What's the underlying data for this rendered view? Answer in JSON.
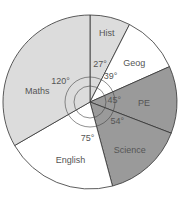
{
  "chart_data": {
    "type": "pie",
    "title": "",
    "start_angle_deg": 0,
    "direction": "clockwise",
    "categories": [
      "Hist",
      "Geog",
      "PE",
      "Science",
      "English",
      "Maths"
    ],
    "values": [
      27,
      39,
      45,
      54,
      75,
      120
    ],
    "value_labels": [
      "27°",
      "39°",
      "45°",
      "54°",
      "75°",
      "120°"
    ],
    "unit": "degrees",
    "total": 360,
    "colors": [
      "#dcdcdc",
      "#ffffff",
      "#9a9a9a",
      "#9a9a9a",
      "#ffffff",
      "#dcdcdc"
    ],
    "legend": "none (labels inside slices)"
  }
}
